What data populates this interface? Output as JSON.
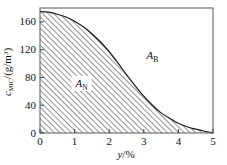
{
  "chart_data": {
    "type": "area",
    "title": "",
    "xlabel": "y/%",
    "xlabel_var": "y",
    "xlabel_sep": "/",
    "xlabel_unit": "%",
    "ylabel": "c_MIC/(g/m3)",
    "ylabel_var": "c",
    "ylabel_sub": "MIC",
    "ylabel_rest": "/(g/m",
    "ylabel_sup": "3",
    "ylabel_close": ")",
    "xlim": [
      0,
      5
    ],
    "ylim": [
      0,
      180
    ],
    "xticks": [
      "0",
      "1",
      "2",
      "3",
      "4",
      "5"
    ],
    "xtick_values": [
      0,
      1,
      2,
      3,
      4,
      5
    ],
    "yticks": [
      "0",
      "40",
      "80",
      "120",
      "160"
    ],
    "ytick_values": [
      0,
      40,
      80,
      120,
      160
    ],
    "grid": false,
    "legend": "none",
    "series": [
      {
        "name": "boundary-curve",
        "x": [
          0,
          0.25,
          0.5,
          0.75,
          1,
          1.25,
          1.5,
          1.75,
          2,
          2.25,
          2.5,
          2.75,
          3,
          3.25,
          3.5,
          3.75,
          4,
          4.25,
          4.5,
          4.75,
          5
        ],
        "values": [
          175,
          174,
          171,
          167,
          161,
          153,
          143,
          131,
          117,
          101,
          84,
          68,
          53,
          40,
          29,
          21,
          14,
          9,
          5.5,
          2.5,
          0
        ]
      }
    ],
    "fill_region": {
      "name": "hatched-area-below-curve",
      "pattern": "diagonal-hatch",
      "color": "#333333"
    },
    "annotations": [
      {
        "name": "region-label-an",
        "text": "A",
        "subscript": "N",
        "x": 1.2,
        "y": 72,
        "boxed": true
      },
      {
        "name": "region-label-ab",
        "text": "A",
        "subscript": "B",
        "x": 3.25,
        "y": 112,
        "boxed": false
      }
    ]
  },
  "figure": {
    "frame_color": "#555555",
    "curve_color": "#1a1a1a",
    "background": "#ffffff"
  }
}
